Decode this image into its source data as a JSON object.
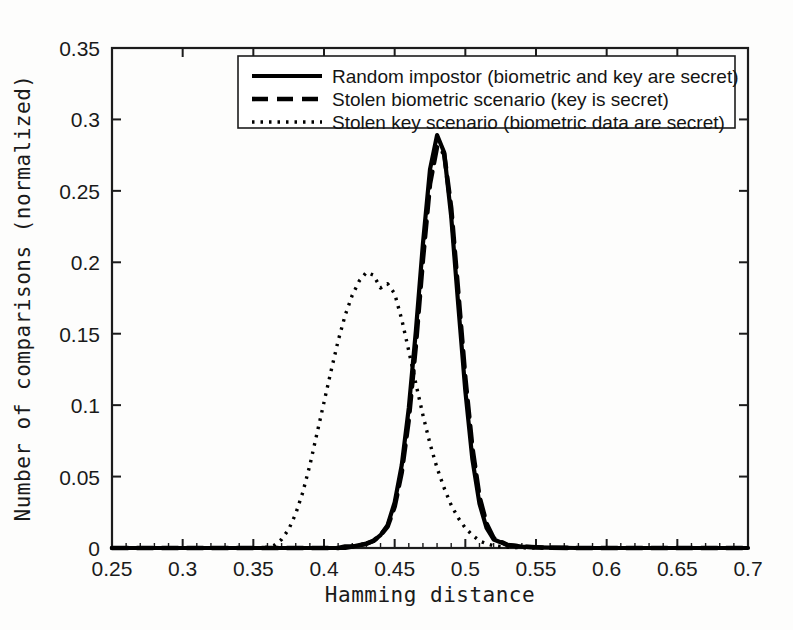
{
  "chart_data": {
    "type": "line",
    "title": "",
    "xlabel": "Hamming distance",
    "ylabel": "Number of comparisons (normalized)",
    "xlim": [
      0.25,
      0.7
    ],
    "ylim": [
      0,
      0.35
    ],
    "xticks": [
      "0.25",
      "0.3",
      "0.35",
      "0.4",
      "0.45",
      "0.5",
      "0.55",
      "0.6",
      "0.65",
      "0.7"
    ],
    "xtick_values": [
      0.25,
      0.3,
      0.35,
      0.4,
      0.45,
      0.5,
      0.55,
      0.6,
      0.65,
      0.7
    ],
    "yticks": [
      "0",
      "0.05",
      "0.1",
      "0.15",
      "0.2",
      "0.25",
      "0.3",
      "0.35"
    ],
    "ytick_values": [
      0,
      0.05,
      0.1,
      0.15,
      0.2,
      0.25,
      0.3,
      0.35
    ],
    "grid": false,
    "legend_position": "top-right",
    "x": [
      0.25,
      0.26,
      0.27,
      0.28,
      0.29,
      0.3,
      0.31,
      0.32,
      0.33,
      0.34,
      0.35,
      0.36,
      0.365,
      0.37,
      0.375,
      0.38,
      0.385,
      0.39,
      0.395,
      0.4,
      0.405,
      0.41,
      0.415,
      0.42,
      0.425,
      0.43,
      0.435,
      0.44,
      0.445,
      0.45,
      0.455,
      0.46,
      0.465,
      0.47,
      0.475,
      0.48,
      0.485,
      0.49,
      0.495,
      0.5,
      0.505,
      0.51,
      0.515,
      0.52,
      0.53,
      0.54,
      0.55,
      0.56,
      0.58,
      0.6,
      0.62,
      0.65,
      0.68,
      0.7
    ],
    "series": [
      {
        "name": "Random impostor (biometric and key are secret)",
        "style": "solid",
        "color": "#000000",
        "peak_x": 0.4725,
        "peak_y": 0.289,
        "values": [
          0,
          0,
          0,
          0,
          0,
          0,
          0,
          0,
          0,
          0,
          0,
          0,
          0,
          0,
          0,
          0,
          0,
          0,
          0,
          0,
          0,
          0,
          0,
          0.001,
          0.002,
          0.003,
          0.005,
          0.009,
          0.016,
          0.032,
          0.058,
          0.098,
          0.152,
          0.213,
          0.265,
          0.289,
          0.277,
          0.232,
          0.17,
          0.11,
          0.062,
          0.031,
          0.014,
          0.006,
          0.002,
          0.001,
          0.0005,
          0.0002,
          0,
          0,
          0,
          0,
          0,
          0
        ]
      },
      {
        "name": "Stolen biometric scenario (key is secret)",
        "style": "dashed",
        "color": "#000000",
        "peak_x": 0.4755,
        "peak_y": 0.281,
        "values": [
          0,
          0,
          0,
          0,
          0,
          0,
          0,
          0,
          0,
          0,
          0,
          0,
          0,
          0,
          0,
          0,
          0,
          0,
          0,
          0,
          0,
          0,
          0.001,
          0.001,
          0.002,
          0.003,
          0.005,
          0.009,
          0.015,
          0.029,
          0.053,
          0.09,
          0.142,
          0.202,
          0.255,
          0.281,
          0.276,
          0.238,
          0.179,
          0.119,
          0.07,
          0.036,
          0.017,
          0.007,
          0.002,
          0.001,
          0.0005,
          0.0002,
          0,
          0,
          0,
          0,
          0,
          0
        ]
      },
      {
        "name": "Stolen key scenario (biometric data are secret)",
        "style": "dotted",
        "color": "#000000",
        "peak_x": 0.4295,
        "peak_y": 0.193,
        "values": [
          0,
          0,
          0,
          0,
          0,
          0,
          0,
          0,
          0,
          0,
          0,
          0.0005,
          0.002,
          0.006,
          0.013,
          0.024,
          0.039,
          0.058,
          0.08,
          0.102,
          0.124,
          0.145,
          0.163,
          0.177,
          0.187,
          0.193,
          0.191,
          0.182,
          0.185,
          0.178,
          0.16,
          0.138,
          0.115,
          0.093,
          0.073,
          0.056,
          0.042,
          0.03,
          0.021,
          0.014,
          0.009,
          0.005,
          0.003,
          0.0015,
          0.0005,
          0.0002,
          0,
          0,
          0,
          0,
          0,
          0,
          0,
          0
        ]
      }
    ]
  },
  "axes": {
    "xlabel": "Hamming distance",
    "ylabel": "Number of comparisons (normalized)"
  },
  "legend": {
    "entries": [
      {
        "label": "Random impostor (biometric and key are secret)",
        "style": "solid"
      },
      {
        "label": "Stolen biometric scenario (key is secret)",
        "style": "dashed"
      },
      {
        "label": "Stolen key scenario (biometric data are secret)",
        "style": "dotted"
      }
    ]
  }
}
